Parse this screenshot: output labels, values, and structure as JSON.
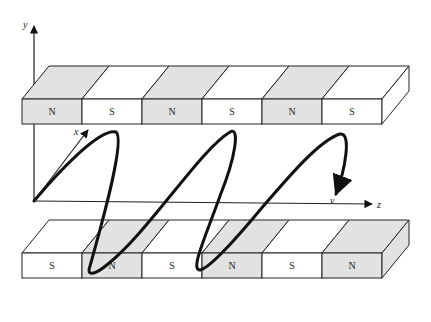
{
  "figure": {
    "axes": {
      "y_label": "y",
      "x_label": "x",
      "z_label": "z"
    },
    "velocity_label": "v",
    "top_magnet_row": {
      "poles": [
        "N",
        "S",
        "N",
        "S",
        "N",
        "S"
      ]
    },
    "bottom_magnet_row": {
      "poles": [
        "S",
        "N",
        "S",
        "N",
        "S",
        "N"
      ]
    },
    "colors": {
      "north_pole_fill": "#e2e2e2",
      "south_pole_fill": "#ffffff",
      "outline": "#222222",
      "trajectory": "#111111"
    }
  }
}
